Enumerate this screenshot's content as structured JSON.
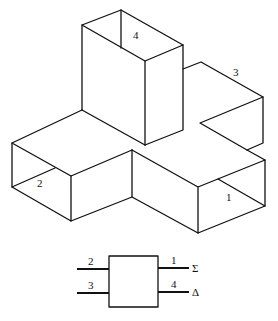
{
  "diagram": {
    "type": "magic-tee waveguide junction",
    "ports_3d": {
      "port1": "1",
      "port2": "2",
      "port3": "3",
      "port4": "4"
    },
    "schematic": {
      "left_top": "2",
      "left_bottom": "3",
      "right_top": "1",
      "right_bottom": "4",
      "sum_symbol": "Σ",
      "diff_symbol": "Δ"
    }
  }
}
